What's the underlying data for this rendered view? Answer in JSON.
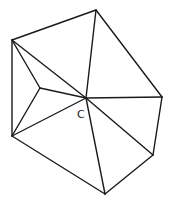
{
  "diagram": {
    "type": "planar-graph",
    "vertices": [
      {
        "id": "A",
        "x": 12,
        "y": 40,
        "label": ""
      },
      {
        "id": "B",
        "x": 96,
        "y": 10,
        "label": ""
      },
      {
        "id": "R",
        "x": 162,
        "y": 97,
        "label": ""
      },
      {
        "id": "LR",
        "x": 153,
        "y": 155,
        "label": ""
      },
      {
        "id": "Bo",
        "x": 105,
        "y": 194,
        "label": ""
      },
      {
        "id": "BL",
        "x": 12,
        "y": 136,
        "label": ""
      },
      {
        "id": "I",
        "x": 40,
        "y": 88,
        "label": ""
      },
      {
        "id": "C",
        "x": 86,
        "y": 98,
        "label": "C"
      }
    ],
    "edges": [
      [
        "A",
        "B"
      ],
      [
        "B",
        "R"
      ],
      [
        "R",
        "LR"
      ],
      [
        "LR",
        "Bo"
      ],
      [
        "Bo",
        "BL"
      ],
      [
        "BL",
        "A"
      ],
      [
        "C",
        "A"
      ],
      [
        "C",
        "B"
      ],
      [
        "C",
        "R"
      ],
      [
        "C",
        "LR"
      ],
      [
        "C",
        "Bo"
      ],
      [
        "C",
        "BL"
      ],
      [
        "I",
        "A"
      ],
      [
        "I",
        "BL"
      ],
      [
        "I",
        "C"
      ]
    ],
    "center_label": {
      "text": "C",
      "x": 77,
      "y": 118
    }
  }
}
